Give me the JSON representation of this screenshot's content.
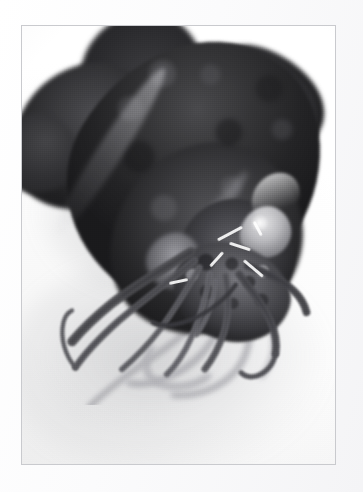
{
  "image": {
    "title": "Squid specimen photograph",
    "subject": "squid",
    "alt_text": "Black and white photograph of a squid specimen lying on a white surface, mantle and fins at upper left, head and arm crown at center right, long arms and tentacles trailing toward the lower left",
    "medium": "black-and-white photograph",
    "orientation": "portrait",
    "background_description": "plain white studio surface",
    "caption": ""
  },
  "frame": {
    "border_color": "#c9cace",
    "mat_color": "#fdfdfd",
    "photo_background": "#ffffff",
    "left": 21,
    "top": 25,
    "width": 315,
    "height": 440
  },
  "palette": {
    "deepest_black": "#1a1a1c",
    "mantle_dark": "#2a2a2c",
    "mantle_mid": "#4a4a4d",
    "arm_gray": "#6b6b70",
    "soft_shadow": "#a8a8ad",
    "paper_white": "#ffffff",
    "highlight_white": "#f2f2f2"
  },
  "subject_parts": [
    {
      "id": "mantle",
      "label": "Mantle",
      "tone": "very dark, mottled"
    },
    {
      "id": "fin-left",
      "label": "Left fin lobe",
      "tone": "dark gray"
    },
    {
      "id": "fin-right",
      "label": "Right fin lobe",
      "tone": "dark gray"
    },
    {
      "id": "head",
      "label": "Head",
      "tone": "mid gray"
    },
    {
      "id": "eye",
      "label": "Eye",
      "tone": "pale highlight"
    },
    {
      "id": "funnel",
      "label": "Funnel",
      "tone": "mid gray"
    },
    {
      "id": "arm-crown",
      "label": "Arm crown",
      "tone": "speckled gray"
    },
    {
      "id": "arms",
      "label": "Arms and tentacles",
      "tone": "gray, tapering"
    },
    {
      "id": "cast-shadow",
      "label": "Cast shadow",
      "tone": "light gray"
    }
  ],
  "arms": {
    "front": [
      {
        "id": "arm-1",
        "label": "Upper left arm",
        "d": "M196 262 C 170 278, 132 300, 104 322 C 84 338, 70 352, 58 366",
        "w": 11,
        "tone": "#4c4c50"
      },
      {
        "id": "arm-2",
        "label": "Long left arm",
        "d": "M200 272 C 176 292, 140 318, 112 342 C 92 360, 74 378, 62 396",
        "w": 8,
        "tone": "#57575c"
      },
      {
        "id": "arm-3",
        "label": "Left hook tentacle",
        "d": "M62 396 C 50 382, 44 362, 48 344 C 50 336, 54 332, 58 330",
        "w": 5,
        "tone": "#5c5c61"
      },
      {
        "id": "arm-4",
        "label": "Center left arm",
        "d": "M206 280 C 192 304, 176 330, 160 352 C 146 370, 130 386, 116 398",
        "w": 7,
        "tone": "#636368"
      },
      {
        "id": "arm-5",
        "label": "Center arm",
        "d": "M218 288 C 214 314, 206 340, 196 362 C 188 380, 178 394, 168 404",
        "w": 7,
        "tone": "#6a6a70"
      },
      {
        "id": "arm-6",
        "label": "Center right arm",
        "d": "M236 290 C 240 312, 240 336, 234 356 C 228 374, 220 388, 212 398",
        "w": 8,
        "tone": "#5a5a5f"
      },
      {
        "id": "arm-7",
        "label": "Right arm",
        "d": "M252 288 C 266 306, 280 324, 288 342 C 294 356, 296 368, 294 380",
        "w": 9,
        "tone": "#4e4e53"
      },
      {
        "id": "arm-8",
        "label": "Right hook tentacle",
        "d": "M294 380 C 292 392, 284 402, 272 406 C 264 408, 258 406, 254 402",
        "w": 6,
        "tone": "#55555a"
      },
      {
        "id": "arm-9",
        "label": "Outer right arm",
        "d": "M262 278 C 284 286, 304 296, 316 308 C 324 316, 328 324, 330 332",
        "w": 9,
        "tone": "#46464b"
      },
      {
        "id": "arm-10",
        "label": "Short lower arm",
        "d": "M224 296 C 222 320, 214 342, 202 358",
        "w": 6,
        "tone": "#6e6e74"
      },
      {
        "id": "arm-11",
        "label": "Crossing tentacle",
        "d": "M248 300 C 232 322, 208 338, 186 344 C 172 348, 160 348, 152 344",
        "w": 5,
        "tone": "#3c3c41"
      }
    ],
    "back": [
      {
        "id": "arm-b1",
        "label": "Faint trailing tentacle",
        "d": "M214 330 C 196 352, 170 372, 146 388 C 120 406, 96 424, 78 442",
        "w": 7,
        "tone": "#b4b4b9"
      },
      {
        "id": "arm-b2",
        "label": "Faint looping tentacle",
        "d": "M236 326 C 230 354, 214 380, 190 396 C 166 412, 142 418, 124 414",
        "w": 8,
        "tone": "#b8b8bd"
      },
      {
        "id": "arm-b3",
        "label": "Faint curled tentacle",
        "d": "M150 374 C 140 390, 142 406, 158 414 C 176 422, 200 418, 216 406",
        "w": 9,
        "tone": "#c0c0c5"
      },
      {
        "id": "arm-b4",
        "label": "Faint lower tentacle",
        "d": "M262 330 C 268 360, 262 388, 242 406 C 222 424, 196 430, 176 428",
        "w": 8,
        "tone": "#bcbcc1"
      },
      {
        "id": "arm-b5",
        "label": "Faint outer tentacle",
        "d": "M286 336 C 296 362, 294 388, 278 406",
        "w": 7,
        "tone": "#c4c4c9"
      }
    ]
  },
  "wisps": [
    {
      "label": "mouth filament 1",
      "left": "62%",
      "top": "47%",
      "w": "9%",
      "h": "0.7%",
      "rot": "-28deg"
    },
    {
      "label": "mouth filament 2",
      "left": "66%",
      "top": "50%",
      "w": "7%",
      "h": "0.6%",
      "rot": "18deg"
    },
    {
      "label": "mouth filament 3",
      "left": "59%",
      "top": "53%",
      "w": "6%",
      "h": "0.6%",
      "rot": "-48deg"
    },
    {
      "label": "mouth filament 4",
      "left": "70%",
      "top": "55%",
      "w": "8%",
      "h": "0.6%",
      "rot": "40deg"
    },
    {
      "label": "mouth filament 5",
      "left": "47%",
      "top": "58%",
      "w": "6%",
      "h": "0.6%",
      "rot": "-12deg"
    },
    {
      "label": "mouth filament 6",
      "left": "73%",
      "top": "46%",
      "w": "5%",
      "h": "0.6%",
      "rot": "62deg"
    }
  ]
}
